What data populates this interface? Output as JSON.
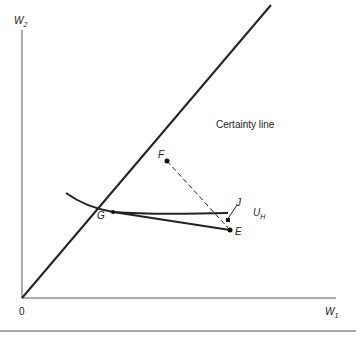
{
  "diagram": {
    "axes": {
      "y_label": "W",
      "y_sub": "2",
      "x_label": "W",
      "x_sub": "1",
      "origin_label": "0"
    },
    "certainty_line_label": "Certainty line",
    "points": {
      "F": "F",
      "G": "G",
      "J": "J",
      "E": "E"
    },
    "curve_label": "U",
    "curve_sub": "H",
    "colors": {
      "line": "#222222",
      "axis": "#444444",
      "rule": "#888888"
    }
  }
}
